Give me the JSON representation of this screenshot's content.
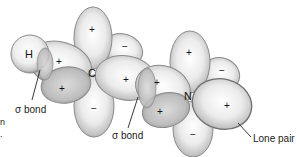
{
  "diagram": {
    "type": "molecular orbital diagram (H–C–N sigma bonds)",
    "atoms": [
      {
        "symbol": "H",
        "x": 30,
        "y": 55
      },
      {
        "symbol": "C",
        "x": 93,
        "y": 73
      },
      {
        "symbol": "N",
        "x": 189,
        "y": 97
      }
    ],
    "lobe_signs": {
      "h_c_bond": "+",
      "c_top": "+",
      "c_upper_right": "−",
      "c_right": "+",
      "c_lower_left": "+",
      "c_bottom": "−",
      "n_left": "+",
      "n_top": "+",
      "n_upper_right": "−",
      "n_right": "+",
      "n_lower_left": "+",
      "n_bottom": "−"
    },
    "labels": {
      "sigma_bond_1": "σ bond",
      "sigma_bond_2": "σ bond",
      "lone_pair": "Lone pair"
    },
    "edge_fragments": {
      "frag1": "n",
      "frag2": "."
    },
    "colors": {
      "lobe_fill_light": "#f4f4f4",
      "lobe_fill_dark": "#a8a8a8",
      "lobe_stroke": "#8a8a8a",
      "text": "#222222"
    }
  }
}
